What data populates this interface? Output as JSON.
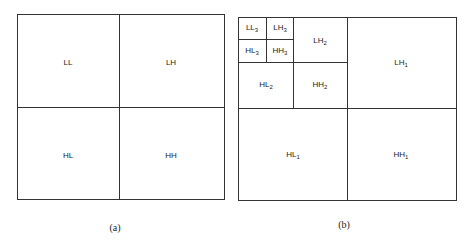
{
  "diagram_a": {
    "caption": "(a)",
    "bands": [
      {
        "name": "LL",
        "x": 68,
        "y": 62
      },
      {
        "name": "LH",
        "x": 171,
        "y": 62
      },
      {
        "name": "HL",
        "x": 68,
        "y": 155
      },
      {
        "name": "HH",
        "x": 171,
        "y": 155
      }
    ]
  },
  "diagram_b": {
    "caption": "(b)",
    "bands": [
      {
        "base": "LL",
        "sub": "3",
        "x": 252,
        "y": 28
      },
      {
        "base": "LH",
        "sub": "3",
        "x": 280,
        "y": 28
      },
      {
        "base": "HL",
        "sub": "3",
        "x": 252,
        "y": 51
      },
      {
        "base": "HH",
        "sub": "3",
        "x": 280,
        "y": 51
      },
      {
        "base": "LH",
        "sub": "2",
        "x": 320,
        "y": 41
      },
      {
        "base": "HL",
        "sub": "2",
        "x": 266,
        "y": 85
      },
      {
        "base": "HH",
        "sub": "2",
        "x": 320,
        "y": 85
      },
      {
        "base": "LH",
        "sub": "1",
        "x": 401,
        "y": 63
      },
      {
        "base": "HL",
        "sub": "1",
        "x": 293,
        "y": 155
      },
      {
        "base": "HH",
        "sub": "1",
        "x": 401,
        "y": 155
      }
    ]
  }
}
